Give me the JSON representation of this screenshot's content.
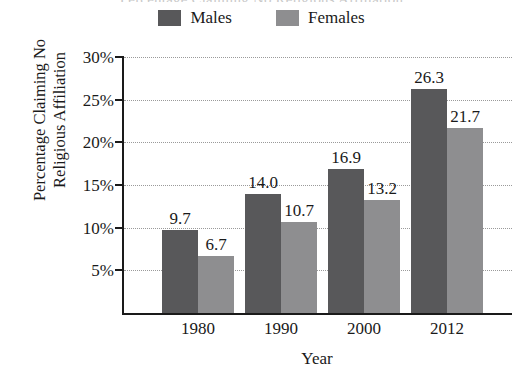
{
  "figure": {
    "title_remnant": "Percentage Claiming No Religious Affiliation",
    "xtitle": "Year",
    "ytitle_line1": "Percentage Claiming No",
    "ytitle_line2": "Religious Affiliation"
  },
  "legend": {
    "items": [
      {
        "label": "Males",
        "color": "#58585a",
        "swatch_name": "legend-swatch-males"
      },
      {
        "label": "Females",
        "color": "#8e8e90",
        "swatch_name": "legend-swatch-females"
      }
    ]
  },
  "axis": {
    "y_ticks": [
      "5%",
      "10%",
      "15%",
      "20%",
      "25%",
      "30%"
    ],
    "y_tick_values": [
      5,
      10,
      15,
      20,
      25,
      30
    ],
    "x_ticks": [
      "1980",
      "1990",
      "2000",
      "2012"
    ]
  },
  "bar_labels": {
    "g0_males": "9.7",
    "g0_females": "6.7",
    "g1_males": "14.0",
    "g1_females": "10.7",
    "g2_males": "16.9",
    "g2_females": "13.2",
    "g3_males": "26.3",
    "g3_females": "21.7"
  },
  "chart_data": {
    "type": "bar",
    "title": "Percentage Claiming No Religious Affiliation",
    "xlabel": "Year",
    "ylabel": "Percentage Claiming No Religious Affiliation",
    "categories": [
      "1980",
      "1990",
      "2000",
      "2012"
    ],
    "series": [
      {
        "name": "Males",
        "color": "#58585a",
        "values": [
          9.7,
          14.0,
          16.9,
          26.3
        ]
      },
      {
        "name": "Females",
        "color": "#8e8e90",
        "values": [
          6.7,
          10.7,
          13.2,
          21.7
        ]
      }
    ],
    "ylim": [
      0,
      30
    ],
    "ytick_interval": 5,
    "ytick_labels": [
      "5%",
      "10%",
      "15%",
      "20%",
      "25%",
      "30%"
    ],
    "grid": "horizontal-dotted",
    "legend_position": "top-center",
    "data_labels": true
  }
}
